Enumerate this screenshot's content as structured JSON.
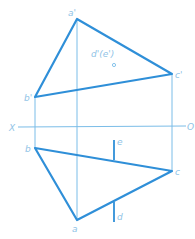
{
  "diagram": {
    "type": "orthographic-projection",
    "colors": {
      "thick_line": "#2f8fd8",
      "thin_line": "#7bbde8",
      "label": "#8fc3e6",
      "background": "#ffffff"
    },
    "axis": {
      "left_label": "X",
      "right_label": "O"
    },
    "front_view": {
      "labels": {
        "a": "a'",
        "b": "b'",
        "c": "c'",
        "de": "d'(e')"
      }
    },
    "top_view": {
      "labels": {
        "a": "a",
        "b": "b",
        "c": "c",
        "d": "d",
        "e": "e"
      }
    }
  }
}
